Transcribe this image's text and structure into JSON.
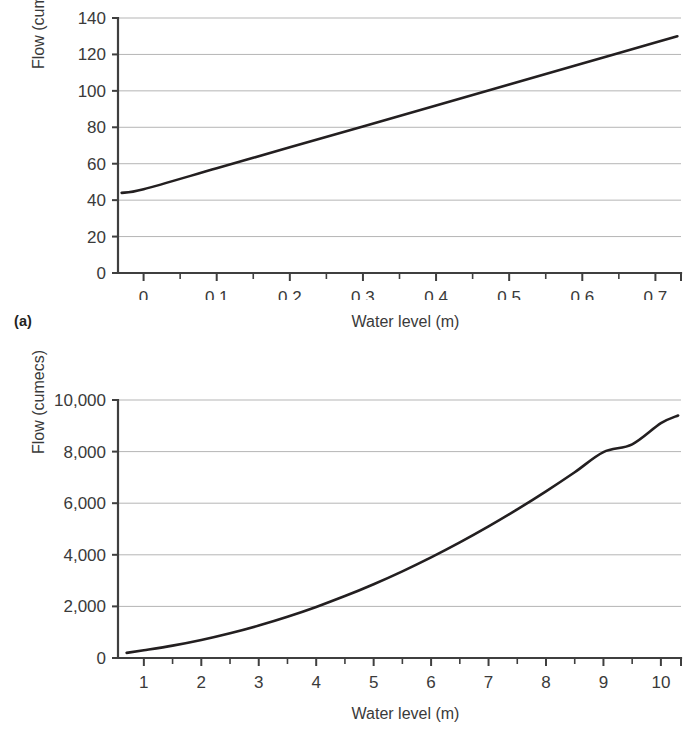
{
  "document": {
    "background_color": "#ffffff",
    "line_color": "#231f20",
    "grid_color": "#b5b5b5",
    "axis_color": "#3f3f3f",
    "text_color": "#3a3a3a"
  },
  "panels": [
    {
      "caption": "(a)",
      "y_axis_title": "Flow (cumecs)",
      "x_axis_title": "Water level (m)"
    },
    {
      "caption": "(b)",
      "y_axis_title": "Flow (cumecs)",
      "x_axis_title": "Water level (m)"
    }
  ],
  "chart_data": [
    {
      "type": "line",
      "title": "",
      "panel_label": "(a)",
      "xlabel": "Water level (m)",
      "ylabel": "Flow (cumecs)",
      "xlim": [
        -0.035,
        0.735
      ],
      "ylim": [
        0,
        140
      ],
      "grid": "horizontal",
      "legend": "none",
      "x_major_ticks": [
        0,
        0.1,
        0.2,
        0.3,
        0.4,
        0.5,
        0.6,
        0.7
      ],
      "x_tick_labels": [
        "0",
        "0.1",
        "0.2",
        "0.3",
        "0.4",
        "0.5",
        "0.6",
        "0.7"
      ],
      "x_minor_tick_step": 0.05,
      "y_major_ticks": [
        0,
        20,
        40,
        60,
        80,
        100,
        120,
        140
      ],
      "y_tick_labels": [
        "0",
        "20",
        "40",
        "60",
        "80",
        "100",
        "120",
        "140"
      ],
      "series": [
        {
          "name": "Rating curve (low flow)",
          "x": [
            -0.03,
            0.0,
            0.1,
            0.2,
            0.3,
            0.4,
            0.5,
            0.6,
            0.7,
            0.73
          ],
          "values": [
            44,
            46,
            57.5,
            69,
            80.5,
            92,
            103.5,
            115,
            126.5,
            130
          ]
        }
      ]
    },
    {
      "type": "line",
      "title": "",
      "panel_label": "(b)",
      "xlabel": "Water level (m)",
      "ylabel": "Flow (cumecs)",
      "xlim": [
        0.55,
        10.35
      ],
      "ylim": [
        0,
        10000
      ],
      "grid": "horizontal",
      "legend": "none",
      "x_major_ticks": [
        1,
        2,
        3,
        4,
        5,
        6,
        7,
        8,
        9,
        10
      ],
      "x_tick_labels": [
        "1",
        "2",
        "3",
        "4",
        "5",
        "6",
        "7",
        "8",
        "9",
        "10"
      ],
      "x_minor_tick_step": 0.5,
      "y_major_ticks": [
        0,
        2000,
        4000,
        6000,
        8000,
        10000
      ],
      "y_tick_labels": [
        "0",
        "2,000",
        "4,000",
        "6,000",
        "8,000",
        "10,000"
      ],
      "series": [
        {
          "name": "Rating curve (high flow)",
          "x": [
            0.7,
            1,
            1.5,
            2,
            2.5,
            3,
            3.5,
            4,
            4.5,
            5,
            5.5,
            6,
            6.5,
            7,
            7.5,
            8,
            8.5,
            9,
            9.5,
            10,
            10.3
          ],
          "values": [
            200,
            300,
            480,
            700,
            960,
            1260,
            1600,
            1980,
            2400,
            2860,
            3360,
            3900,
            4480,
            5100,
            5760,
            6460,
            7200,
            7980,
            8280,
            9100,
            9400
          ]
        }
      ]
    }
  ]
}
